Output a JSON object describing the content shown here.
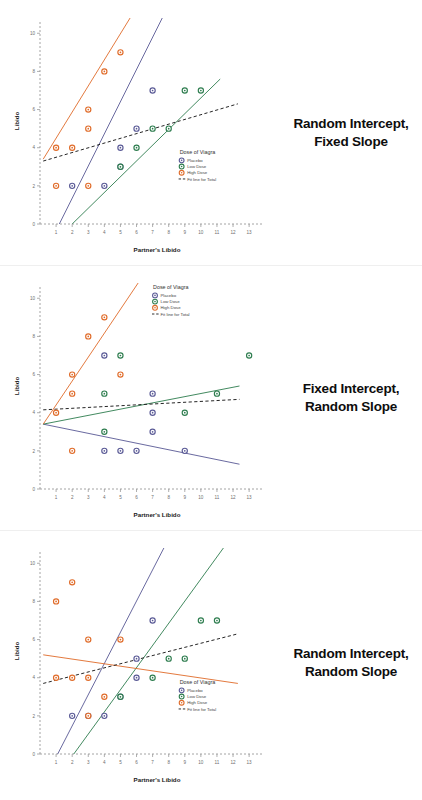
{
  "page": {
    "background": "#ffffff",
    "width": 422,
    "height": 800
  },
  "colors": {
    "placebo": "#5a5a96",
    "low_dose": "#2e7d4f",
    "high_dose": "#e06c2a",
    "fit_total": "#1a1a1a",
    "axis": "#9a9a9a",
    "tick_text": "#6e6e6e",
    "caption_text": "#0d0d0d"
  },
  "panels": [
    {
      "id": "random-intercept-fixed-slope",
      "caption_line1": "Random Intercept,",
      "caption_line2": "Fixed Slope",
      "legend": {
        "title": "Dose of Viagra",
        "items": [
          "Placebo",
          "Low Dose",
          "High Dose",
          "Fit line for Total"
        ],
        "position": "bottom-right"
      },
      "chart_data": {
        "type": "scatter",
        "title": "Random Intercept, Fixed Slope",
        "xlabel": "Partner's Libido",
        "ylabel": "Libido",
        "xlim": [
          0,
          13.8
        ],
        "ylim": [
          0,
          10.8
        ],
        "xticks": [
          1,
          2,
          3,
          4,
          5,
          6,
          7,
          8,
          9,
          10,
          11,
          12,
          13
        ],
        "yticks": [
          0,
          2,
          4,
          6,
          8,
          10
        ],
        "grid": false,
        "series": [
          {
            "name": "Placebo",
            "color": "#5a5a96",
            "points": [
              [
                2,
                2
              ],
              [
                4,
                2
              ],
              [
                5,
                3
              ],
              [
                5,
                4
              ],
              [
                6,
                5
              ],
              [
                7,
                7
              ]
            ],
            "fit_line": {
              "x0": 1.2,
              "y0": 0.0,
              "x1": 7.6,
              "y1": 10.8
            }
          },
          {
            "name": "Low Dose",
            "color": "#2e7d4f",
            "points": [
              [
                5,
                3
              ],
              [
                6,
                4
              ],
              [
                7,
                5
              ],
              [
                8,
                5
              ],
              [
                9,
                7
              ],
              [
                10,
                7
              ]
            ],
            "fit_line": {
              "x0": 2.0,
              "y0": 0.0,
              "x1": 11.2,
              "y1": 7.6
            }
          },
          {
            "name": "High Dose",
            "color": "#e06c2a",
            "points": [
              [
                1,
                2
              ],
              [
                1,
                4
              ],
              [
                2,
                4
              ],
              [
                3,
                2
              ],
              [
                3,
                5
              ],
              [
                3,
                6
              ],
              [
                4,
                8
              ],
              [
                5,
                9
              ]
            ],
            "fit_line": {
              "x0": 0.2,
              "y0": 3.4,
              "x1": 5.6,
              "y1": 10.8
            }
          }
        ],
        "fit_line_total": {
          "name": "Fit line for Total",
          "color": "#1a1a1a",
          "dashed": true,
          "x0": 0.2,
          "y0": 3.3,
          "x1": 12.3,
          "y1": 6.3
        }
      }
    },
    {
      "id": "fixed-intercept-random-slope",
      "caption_line1": "Fixed Intercept,",
      "caption_line2": "Random Slope",
      "legend": {
        "title": "Dose of Viagra",
        "items": [
          "Placebo",
          "Low Dose",
          "High Dose",
          "Fit line for Total"
        ],
        "position": "top-right"
      },
      "chart_data": {
        "type": "scatter",
        "title": "Fixed Intercept, Random Slope",
        "xlabel": "Partner's Libido",
        "ylabel": "Libido",
        "xlim": [
          0,
          13.8
        ],
        "ylim": [
          0,
          10.8
        ],
        "xticks": [
          1,
          2,
          3,
          4,
          5,
          6,
          7,
          8,
          9,
          10,
          11,
          12,
          13
        ],
        "yticks": [
          0,
          2,
          4,
          6,
          8,
          10
        ],
        "grid": false,
        "series": [
          {
            "name": "Placebo",
            "color": "#5a5a96",
            "points": [
              [
                4,
                2
              ],
              [
                5,
                2
              ],
              [
                6,
                2
              ],
              [
                4,
                7
              ],
              [
                7,
                5
              ],
              [
                7,
                4
              ],
              [
                7,
                3
              ],
              [
                9,
                2
              ]
            ],
            "fit_line": {
              "x0": 0.2,
              "y0": 3.4,
              "x1": 12.4,
              "y1": 1.3
            }
          },
          {
            "name": "Low Dose",
            "color": "#2e7d4f",
            "points": [
              [
                4,
                5
              ],
              [
                4,
                3
              ],
              [
                5,
                7
              ],
              [
                9,
                4
              ],
              [
                11,
                5
              ],
              [
                13,
                7
              ]
            ],
            "fit_line": {
              "x0": 0.2,
              "y0": 3.4,
              "x1": 12.4,
              "y1": 5.4
            }
          },
          {
            "name": "High Dose",
            "color": "#e06c2a",
            "points": [
              [
                1,
                4
              ],
              [
                2,
                2
              ],
              [
                2,
                5
              ],
              [
                2,
                6
              ],
              [
                3,
                8
              ],
              [
                4,
                9
              ],
              [
                5,
                6
              ]
            ],
            "fit_line": {
              "x0": 0.2,
              "y0": 3.4,
              "x1": 6.1,
              "y1": 10.8
            }
          }
        ],
        "fit_line_total": {
          "name": "Fit line for Total",
          "color": "#1a1a1a",
          "dashed": true,
          "x0": 0.2,
          "y0": 4.15,
          "x1": 12.4,
          "y1": 4.7
        }
      }
    },
    {
      "id": "random-intercept-random-slope",
      "caption_line1": "Random Intercept,",
      "caption_line2": "Random Slope",
      "legend": {
        "title": "Dose of Viagra",
        "items": [
          "Placebo",
          "Low Dose",
          "High Dose",
          "Fit line for Total"
        ],
        "position": "bottom-right"
      },
      "chart_data": {
        "type": "scatter",
        "title": "Random Intercept, Random Slope",
        "xlabel": "Partner's Libido",
        "ylabel": "Libido",
        "xlim": [
          0,
          13.8
        ],
        "ylim": [
          0,
          10.8
        ],
        "xticks": [
          1,
          2,
          3,
          4,
          5,
          6,
          7,
          8,
          9,
          10,
          11,
          12,
          13
        ],
        "yticks": [
          0,
          2,
          4,
          6,
          8,
          10
        ],
        "grid": false,
        "series": [
          {
            "name": "Placebo",
            "color": "#5a5a96",
            "points": [
              [
                2,
                2
              ],
              [
                3,
                2
              ],
              [
                4,
                2
              ],
              [
                5,
                3
              ],
              [
                6,
                4
              ],
              [
                6,
                5
              ],
              [
                7,
                7
              ]
            ],
            "fit_line": {
              "x0": 1.1,
              "y0": 0.0,
              "x1": 7.7,
              "y1": 10.8
            }
          },
          {
            "name": "Low Dose",
            "color": "#2e7d4f",
            "points": [
              [
                5,
                3
              ],
              [
                7,
                4
              ],
              [
                8,
                5
              ],
              [
                9,
                5
              ],
              [
                10,
                7
              ],
              [
                11,
                7
              ]
            ],
            "fit_line": {
              "x0": 2.1,
              "y0": 0.0,
              "x1": 11.4,
              "y1": 10.8
            }
          },
          {
            "name": "High Dose",
            "color": "#e06c2a",
            "points": [
              [
                1,
                4
              ],
              [
                1,
                8
              ],
              [
                2,
                4
              ],
              [
                2,
                9
              ],
              [
                3,
                4
              ],
              [
                3,
                6
              ],
              [
                3,
                2
              ],
              [
                4,
                3
              ],
              [
                5,
                6
              ]
            ],
            "fit_line": {
              "x0": 0.2,
              "y0": 5.2,
              "x1": 12.3,
              "y1": 3.7
            }
          }
        ],
        "fit_line_total": {
          "name": "Fit line for Total",
          "color": "#1a1a1a",
          "dashed": true,
          "x0": 0.2,
          "y0": 3.7,
          "x1": 12.3,
          "y1": 6.3
        }
      }
    }
  ]
}
